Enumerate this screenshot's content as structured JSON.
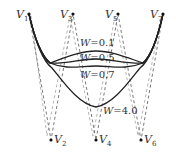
{
  "diagram": {
    "type": "NURBS curve weight variation",
    "control_points": [
      {
        "name": "V",
        "sub": "1",
        "x": 29,
        "y": 14
      },
      {
        "name": "V",
        "sub": "2",
        "x": 51,
        "y": 140
      },
      {
        "name": "V",
        "sub": "3",
        "x": 73,
        "y": 14
      },
      {
        "name": "V",
        "sub": "4",
        "x": 96,
        "y": 140
      },
      {
        "name": "V",
        "sub": "5",
        "x": 118,
        "y": 14
      },
      {
        "name": "V",
        "sub": "6",
        "x": 141,
        "y": 140
      },
      {
        "name": "V",
        "sub": "7",
        "x": 163,
        "y": 14
      }
    ],
    "curves": [
      {
        "weight_var": "W",
        "eq": "=0.1",
        "label": "W=0.1"
      },
      {
        "weight_var": "W",
        "eq": "=0.5",
        "label": "W=0.5"
      },
      {
        "weight_var": "W",
        "eq": "=0.7",
        "label": "W=0.7"
      },
      {
        "weight_var": "W",
        "eq": "=4.0",
        "label": "W=4.0"
      }
    ],
    "colors": {
      "curve": "#222222",
      "control_polygon": "#555555",
      "background": "#ffffff"
    }
  }
}
